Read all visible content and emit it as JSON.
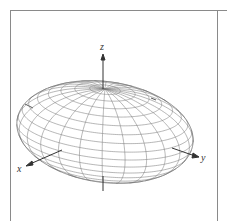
{
  "figure": {
    "frame_color": "#8a8a8a",
    "line_color": "#7a7a7a",
    "axis_color": "#444444"
  },
  "axes": {
    "x": {
      "label": "x"
    },
    "y": {
      "label": "y"
    },
    "z": {
      "label": "z"
    }
  },
  "ellipsoid": {
    "center": [
      105,
      132
    ],
    "semi_axes": {
      "a": 50,
      "b": 78,
      "c": 43
    },
    "proj": {
      "ex": [
        -0.93,
        0.37
      ],
      "ey": [
        0.96,
        0.27
      ],
      "ez": [
        0,
        -1
      ]
    },
    "view": [
      0.96,
      0.93,
      0.606
    ],
    "meridians": 24,
    "parallels": 18
  }
}
